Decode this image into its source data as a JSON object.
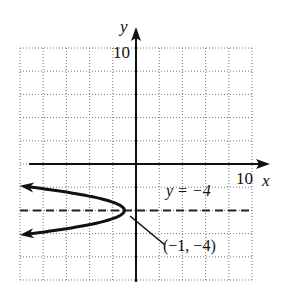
{
  "chart_data": {
    "type": "line",
    "title": "",
    "xlabel": "x",
    "ylabel": "y",
    "xlim": [
      -10,
      10
    ],
    "ylim": [
      -10,
      10
    ],
    "grid": true,
    "grid_step": 2,
    "tick_labels": {
      "x_max": "10",
      "y_max": "10"
    },
    "series": [
      {
        "name": "parabola",
        "equation": "x = -2(y + 4)^2 - 1",
        "style": "solid-thick",
        "arrows": "both-ends",
        "vertex": [
          -1,
          -4
        ],
        "points": [
          [
            -9.5,
            -1.9
          ],
          [
            -7,
            -2.27
          ],
          [
            -3,
            -3
          ],
          [
            -1,
            -4
          ],
          [
            -3,
            -5
          ],
          [
            -7,
            -5.73
          ],
          [
            -9.5,
            -6.1
          ]
        ]
      },
      {
        "name": "axis of symmetry",
        "equation": "y = -4",
        "style": "dashed",
        "x_range": [
          -10,
          10
        ]
      }
    ],
    "annotations": [
      {
        "text": "y = −4",
        "at": [
          4.2,
          -2.3
        ],
        "target": "axis of symmetry"
      },
      {
        "text": "(−1, −4)",
        "at": [
          2.5,
          -7
        ],
        "target": [
          -1,
          -4
        ],
        "leader_line": true
      }
    ]
  },
  "labels": {
    "y_axis": "y",
    "x_axis": "x",
    "y_max": "10",
    "x_max": "10",
    "sym_line": "y = −4",
    "vertex": "(−1, −4)"
  }
}
